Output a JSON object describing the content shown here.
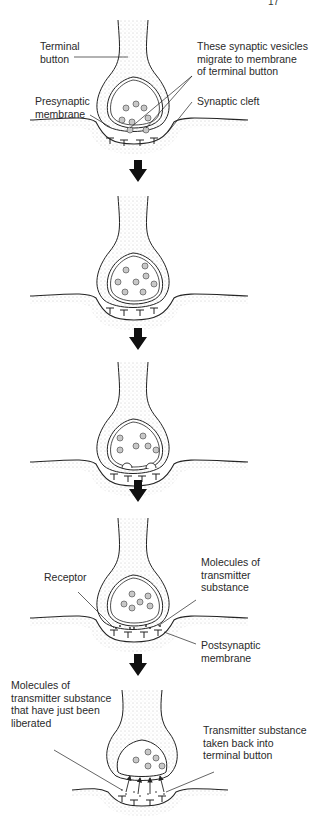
{
  "page": {
    "mark": "17"
  },
  "stages": [
    {
      "index": 1,
      "labels": {
        "terminal_button": "Terminal\nbutton",
        "vesicles": "These synaptic vesicles\nmigrate to membrane\nof terminal button",
        "presynaptic": "Presynaptic\nmembrane",
        "cleft": "Synaptic cleft"
      }
    },
    {
      "index": 2,
      "labels": {}
    },
    {
      "index": 3,
      "labels": {}
    },
    {
      "index": 4,
      "labels": {
        "receptor": "Receptor",
        "molecules": "Molecules of\ntransmitter\nsubstance",
        "postsynaptic": "Postsynaptic\nmembrane"
      }
    },
    {
      "index": 5,
      "labels": {
        "liberated": "Molecules of\ntransmitter substance\nthat have just been\nliberated",
        "reuptake": "Transmitter substance\ntaken back into\nterminal button"
      }
    }
  ],
  "arrows": {
    "count": 4,
    "color": "#111111"
  },
  "colors": {
    "ink": "#222222",
    "stipple": "#9a9a9a",
    "vesicle_fill": "#c8c8c8"
  }
}
